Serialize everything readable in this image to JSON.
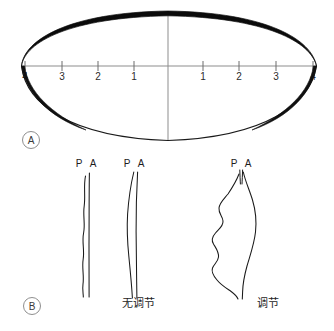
{
  "figure": {
    "background_color": "#ffffff",
    "ink_color": "#111111",
    "scale_color": "#8b8b8b"
  },
  "panels": [
    {
      "id": "A",
      "letter": "A",
      "name": "lens-cross-section",
      "scale": {
        "name": "millimeter-ruler",
        "left_labels": [
          "4",
          "3",
          "2",
          "1"
        ],
        "right_labels": [
          "1",
          "2",
          "3",
          "4"
        ],
        "left_tick_x": [
          25,
          62,
          98,
          134
        ],
        "right_tick_x": [
          203,
          239,
          276,
          313
        ],
        "axis_y": 66,
        "center_x": 168,
        "center_line_top": 11,
        "center_line_bottom": 141
      },
      "lens": {
        "name": "crystalline-lens-outline",
        "left_pole_x": 21,
        "right_pole_x": 317,
        "anterior_apex_y": 11,
        "posterior_apex_y": 140,
        "anterior_stroke_width": 4.2,
        "posterior_stroke_width": 1.1
      }
    },
    {
      "id": "B",
      "letter": "B",
      "name": "accommodation-traces",
      "traces": [
        {
          "name": "trace-narrow-left",
          "labels": {
            "posterior": "P",
            "anterior": "A"
          },
          "caption": ""
        },
        {
          "name": "trace-no-accommodation",
          "labels": {
            "posterior": "P",
            "anterior": "A"
          },
          "caption": "无调节"
        },
        {
          "name": "trace-accommodation",
          "labels": {
            "posterior": "P",
            "anterior": "A"
          },
          "caption": "调节"
        }
      ]
    }
  ],
  "labels": {
    "panel_a_letter": "A",
    "panel_b_letter": "B",
    "tick_l4": "4",
    "tick_l3": "3",
    "tick_l2": "2",
    "tick_l1": "1",
    "tick_r1": "1",
    "tick_r2": "2",
    "tick_r3": "3",
    "tick_r4": "4",
    "pa_p_1": "P",
    "pa_a_1": "A",
    "pa_p_2": "P",
    "pa_a_2": "A",
    "pa_p_3": "P",
    "pa_a_3": "A",
    "caption_no_accommodation": "无调节",
    "caption_accommodation": "调节"
  }
}
